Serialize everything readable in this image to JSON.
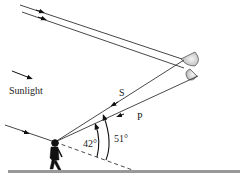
{
  "diagram": {
    "type": "rainbow-formation",
    "labels": {
      "sunlight": "Sunlight",
      "s": "S",
      "p": "P",
      "angle_secondary": "42°",
      "angle_primary": "51°"
    },
    "elements": [
      "sun rays",
      "two raindrops",
      "observer",
      "ground",
      "angle arcs"
    ]
  }
}
